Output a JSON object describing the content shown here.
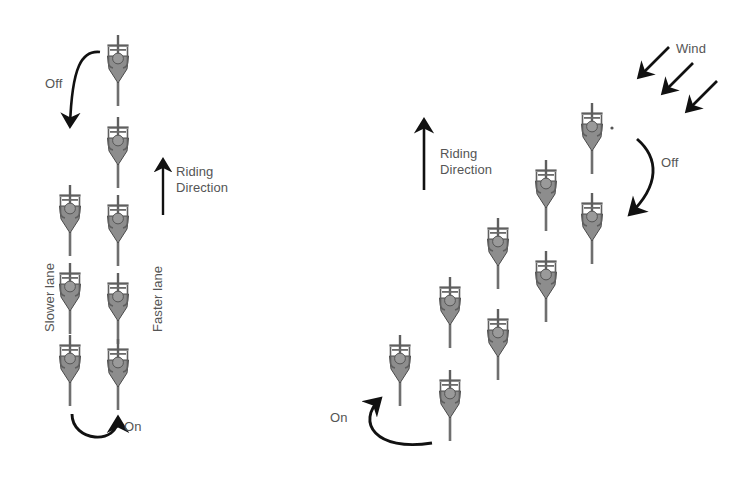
{
  "figure": {
    "title": "",
    "background_color": "#ffffff",
    "text_color": "#555555",
    "arrow_color": "#111111",
    "cyclist_body_color": "#8d8d8d",
    "cyclist_outline_color": "#4a4a4a",
    "cyclist_head_color": "#9a9a9a"
  },
  "left_panel": {
    "name": "double-paceline-diagram",
    "labels": {
      "off": "Off",
      "on": "On",
      "riding_direction_line1": "Riding",
      "riding_direction_line2": "Direction",
      "slower_lane": "Slower lane",
      "faster_lane": "Faster lane"
    },
    "lanes": [
      {
        "name": "slower-lane",
        "label": "Slower lane",
        "rider_count": 3
      },
      {
        "name": "faster-lane",
        "label": "Faster lane",
        "rider_count": 5
      }
    ],
    "riders": [
      {
        "id": "L-F1",
        "lane": "faster",
        "x": 118,
        "y": 30
      },
      {
        "id": "L-F2",
        "lane": "faster",
        "x": 118,
        "y": 112
      },
      {
        "id": "L-F3",
        "lane": "faster",
        "x": 118,
        "y": 190
      },
      {
        "id": "L-F4",
        "lane": "faster",
        "x": 118,
        "y": 268
      },
      {
        "id": "L-F5",
        "lane": "faster",
        "x": 118,
        "y": 334
      },
      {
        "id": "L-S1",
        "lane": "slower",
        "x": 70,
        "y": 180
      },
      {
        "id": "L-S2",
        "lane": "slower",
        "x": 70,
        "y": 258
      },
      {
        "id": "L-S3",
        "lane": "slower",
        "x": 70,
        "y": 330
      }
    ]
  },
  "right_panel": {
    "name": "echelon-diagram",
    "labels": {
      "wind": "Wind",
      "off": "Off",
      "on": "On",
      "riding_direction_line1": "Riding",
      "riding_direction_line2": "Direction"
    },
    "wind_arrows": 3,
    "wind_direction_degrees": 225,
    "riders": [
      {
        "id": "R-A1",
        "line": "front-echelon",
        "x": 583,
        "y": 100
      },
      {
        "id": "R-A2",
        "line": "front-echelon",
        "x": 540,
        "y": 155
      },
      {
        "id": "R-A3",
        "line": "front-echelon",
        "x": 493,
        "y": 212
      },
      {
        "id": "R-A4",
        "line": "front-echelon",
        "x": 446,
        "y": 272
      },
      {
        "id": "R-A5",
        "line": "front-echelon",
        "x": 392,
        "y": 330
      },
      {
        "id": "R-B1",
        "line": "return-line",
        "x": 583,
        "y": 190
      },
      {
        "id": "R-B2",
        "line": "return-line",
        "x": 540,
        "y": 248
      },
      {
        "id": "R-B3",
        "line": "return-line",
        "x": 493,
        "y": 305
      },
      {
        "id": "R-B4",
        "line": "return-line",
        "x": 446,
        "y": 365
      }
    ]
  }
}
